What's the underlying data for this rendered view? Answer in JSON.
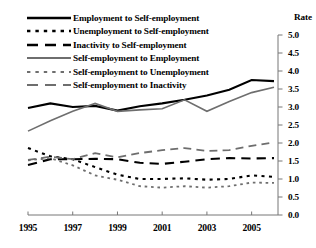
{
  "chart_data": {
    "type": "line",
    "title": "",
    "subtitle": "",
    "xlabel": "",
    "ylabel": "Rate",
    "ylim": [
      0.0,
      5.0
    ],
    "xlim": [
      1995,
      2006
    ],
    "grid": false,
    "legend_position": "top-left",
    "y_ticks": [
      "0.0",
      "0.5",
      "1.0",
      "1.5",
      "2.0",
      "2.5",
      "3.0",
      "3.5",
      "4.0",
      "4.5",
      "5.0"
    ],
    "y_tick_values": [
      0.0,
      0.5,
      1.0,
      1.5,
      2.0,
      2.5,
      3.0,
      3.5,
      4.0,
      4.5,
      5.0
    ],
    "x_ticks": [
      "1995",
      "1997",
      "1999",
      "2001",
      "2003",
      "2005"
    ],
    "x_tick_values": [
      1995,
      1997,
      1999,
      2001,
      2003,
      2005
    ],
    "x": [
      1995,
      1996,
      1997,
      1998,
      1999,
      2000,
      2001,
      2002,
      2003,
      2004,
      2005,
      2006
    ],
    "series": [
      {
        "name": "Employment to Self-employment",
        "style": "solid",
        "color": "#000000",
        "width": 2.1,
        "values": [
          2.97,
          3.1,
          3.0,
          3.03,
          2.9,
          3.02,
          3.1,
          3.2,
          3.32,
          3.48,
          3.75,
          3.72
        ]
      },
      {
        "name": "Unemployment to Self-employment",
        "style": "dotted",
        "color": "#000000",
        "width": 2.1,
        "values": [
          1.86,
          1.63,
          1.55,
          1.33,
          1.12,
          1.0,
          1.0,
          1.02,
          0.98,
          1.0,
          1.1,
          1.06
        ]
      },
      {
        "name": "Inactivity to Self-employment",
        "style": "dashed",
        "color": "#000000",
        "width": 2.1,
        "values": [
          1.39,
          1.55,
          1.55,
          1.56,
          1.55,
          1.45,
          1.42,
          1.48,
          1.55,
          1.58,
          1.57,
          1.58
        ]
      },
      {
        "name": "Self-employment to Employment",
        "style": "solid",
        "color": "#6e6e6e",
        "width": 1.6,
        "values": [
          2.33,
          2.62,
          2.88,
          3.1,
          2.88,
          2.92,
          2.95,
          3.2,
          2.88,
          3.15,
          3.4,
          3.55
        ]
      },
      {
        "name": "Self-employment to Unemployment",
        "style": "dotted",
        "color": "#6e6e6e",
        "width": 1.8,
        "values": [
          1.52,
          1.58,
          1.38,
          1.1,
          0.98,
          0.8,
          0.76,
          0.8,
          0.76,
          0.8,
          0.9,
          0.89
        ]
      },
      {
        "name": "Self-employment to Inactivity",
        "style": "dashed",
        "color": "#6e6e6e",
        "width": 1.8,
        "values": [
          1.53,
          1.62,
          1.55,
          1.72,
          1.6,
          1.72,
          1.8,
          1.86,
          1.78,
          1.8,
          1.92,
          2.02
        ]
      }
    ]
  },
  "axis": {
    "rate_title": "Rate"
  }
}
